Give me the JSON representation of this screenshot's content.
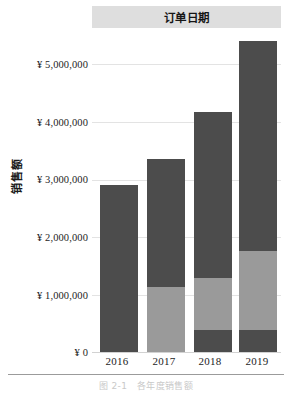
{
  "header": {
    "field_label": "订单日期"
  },
  "axes": {
    "y_title": "销售额",
    "y_ticks": [
      "¥ 5,000,000",
      "¥ 4,000,000",
      "¥ 3,000,000",
      "¥ 2,000,000",
      "¥ 1,000,000",
      "¥ 0"
    ],
    "x_ticks": [
      "2016",
      "2017",
      "2018",
      "2019"
    ]
  },
  "caption": "图 2-1　各年度销售额",
  "colors": {
    "segment_dark": "#4c4c4c",
    "segment_light": "#9a9a9a",
    "header_band": "#dedede",
    "gridline": "#e3e3e3",
    "axis_line": "#d2d2d2"
  },
  "chart_data": {
    "type": "bar",
    "stacked": true,
    "title": "订单日期",
    "xlabel": "",
    "ylabel": "销售额",
    "categories": [
      "2016",
      "2017",
      "2018",
      "2019"
    ],
    "ylim": [
      0,
      5400000
    ],
    "y_tick_values": [
      0,
      1000000,
      2000000,
      3000000,
      4000000,
      5000000
    ],
    "y_tick_labels": [
      "¥ 0",
      "¥ 1,000,000",
      "¥ 2,000,000",
      "¥ 3,000,000",
      "¥ 4,000,000",
      "¥ 5,000,000"
    ],
    "grid": true,
    "legend": "none",
    "series": [
      {
        "name": "底层分段",
        "color": "#4c4c4c",
        "values": [
          0,
          0,
          380000,
          380000
        ]
      },
      {
        "name": "中层分段",
        "color": "#9a9a9a",
        "values": [
          0,
          1130000,
          900000,
          1370000
        ]
      },
      {
        "name": "顶层分段",
        "color": "#4c4c4c",
        "values": [
          2900000,
          2220000,
          2890000,
          3650000
        ]
      }
    ],
    "totals": [
      2900000,
      3350000,
      4170000,
      5400000
    ]
  },
  "bars": [
    {
      "year": "2016",
      "x": 8,
      "segments": [
        {
          "tone": "dark",
          "bottom": 0,
          "height": 167
        }
      ]
    },
    {
      "year": "2017",
      "x": 55,
      "segments": [
        {
          "tone": "light",
          "bottom": 0,
          "height": 65
        },
        {
          "tone": "dark",
          "bottom": 65,
          "height": 128
        }
      ]
    },
    {
      "year": "2018",
      "x": 102,
      "segments": [
        {
          "tone": "dark",
          "bottom": 0,
          "height": 22
        },
        {
          "tone": "light",
          "bottom": 22,
          "height": 52
        },
        {
          "tone": "dark",
          "bottom": 74,
          "height": 166
        }
      ]
    },
    {
      "year": "2019",
      "x": 147,
      "segments": [
        {
          "tone": "dark",
          "bottom": 0,
          "height": 22
        },
        {
          "tone": "light",
          "bottom": 22,
          "height": 79
        },
        {
          "tone": "dark",
          "bottom": 101,
          "height": 210
        }
      ]
    }
  ],
  "gridlines": [
    {
      "top": 36
    },
    {
      "top": 94
    },
    {
      "top": 152
    },
    {
      "top": 209
    },
    {
      "top": 267
    },
    {
      "top": 324
    }
  ],
  "ytick_positions": [
    59,
    117,
    174,
    232,
    290,
    347
  ],
  "xtick_positions": [
    2,
    49,
    95,
    142
  ]
}
